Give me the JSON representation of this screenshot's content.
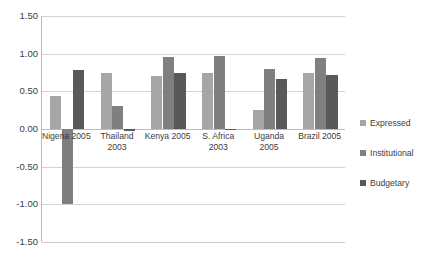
{
  "chart_data": {
    "type": "bar",
    "title": "",
    "subtitle": "",
    "xlabel": "",
    "ylabel": "",
    "ylim": [
      -1.5,
      1.5
    ],
    "yticks": [
      "1.50",
      "1.00",
      "0.50",
      "0.00",
      "-0.50",
      "-1.00",
      "-1.50"
    ],
    "ytick_values": [
      1.5,
      1.0,
      0.5,
      0.0,
      -0.5,
      -1.0,
      -1.5
    ],
    "grid": true,
    "legend_position": "right",
    "categories": [
      "Nigeria 2005",
      "Thailand\n2003",
      "Kenya 2005",
      "S. Africa\n2003",
      "Uganda 2005",
      "Brazil 2005"
    ],
    "series": [
      {
        "name": "Expressed",
        "color": "#a6a6a6",
        "values": [
          0.44,
          0.74,
          0.71,
          0.75,
          0.25,
          0.75
        ]
      },
      {
        "name": "Institutional",
        "color": "#7f7f7f",
        "values": [
          -1.0,
          0.3,
          0.96,
          0.97,
          0.8,
          0.94
        ]
      },
      {
        "name": "Budgetary",
        "color": "#595959",
        "values": [
          0.78,
          -0.03,
          0.74,
          -0.01,
          0.66,
          0.72
        ]
      }
    ]
  },
  "legend": {
    "items": [
      {
        "label": "Expressed",
        "color": "#a6a6a6"
      },
      {
        "label": "Institutional",
        "color": "#7f7f7f"
      },
      {
        "label": "Budgetary",
        "color": "#595959"
      }
    ]
  }
}
